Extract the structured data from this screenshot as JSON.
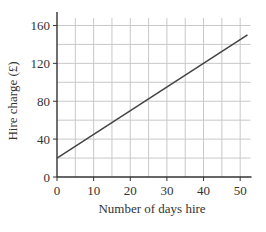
{
  "chart_data": {
    "type": "line",
    "title": "",
    "xlabel": "Number of days hire",
    "ylabel": "Hire charge (£)",
    "xlim": [
      0,
      52
    ],
    "ylim": [
      0,
      170
    ],
    "x_ticks": [
      0,
      10,
      20,
      30,
      40,
      50
    ],
    "y_ticks": [
      0,
      40,
      80,
      120,
      160
    ],
    "grid": true,
    "grid_x_step": 5,
    "grid_y_step": 20,
    "legend": null,
    "series": [
      {
        "name": "Hire charge",
        "x": [
          0,
          52
        ],
        "y": [
          20,
          150
        ],
        "color": "#444444"
      }
    ]
  }
}
